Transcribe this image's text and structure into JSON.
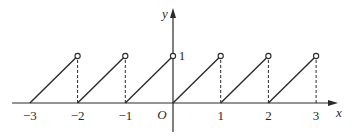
{
  "chart_data": {
    "type": "line",
    "title": "",
    "xlabel": "x",
    "ylabel": "y",
    "origin_label": "O",
    "x_ticks": [
      -3,
      -2,
      -1,
      1,
      2,
      3
    ],
    "x_tick_labels": [
      "−3",
      "−2",
      "−1",
      "1",
      "2",
      "3"
    ],
    "y_ticks": [
      1
    ],
    "y_tick_labels": [
      "1"
    ],
    "xlim": [
      -3.6,
      3.4
    ],
    "ylim": [
      -0.5,
      1.7
    ],
    "grid": false,
    "legend": null,
    "segments": [
      {
        "x": [
          -3,
          -2
        ],
        "y": [
          0,
          1
        ],
        "start": "closed",
        "end": "open"
      },
      {
        "x": [
          -2,
          -1
        ],
        "y": [
          0,
          1
        ],
        "start": "closed",
        "end": "open"
      },
      {
        "x": [
          -1,
          0
        ],
        "y": [
          0,
          1
        ],
        "start": "closed",
        "end": "open"
      },
      {
        "x": [
          0,
          1
        ],
        "y": [
          0,
          1
        ],
        "start": "closed",
        "end": "open"
      },
      {
        "x": [
          1,
          2
        ],
        "y": [
          0,
          1
        ],
        "start": "closed",
        "end": "open"
      },
      {
        "x": [
          2,
          3
        ],
        "y": [
          0,
          1
        ],
        "start": "closed",
        "end": "open"
      }
    ],
    "dashed_verticals": [
      {
        "x": -2,
        "y": [
          0,
          1
        ]
      },
      {
        "x": -1,
        "y": [
          0,
          1
        ]
      },
      {
        "x": 1,
        "y": [
          0,
          1
        ]
      },
      {
        "x": 2,
        "y": [
          0,
          1
        ]
      },
      {
        "x": 3,
        "y": [
          0,
          1
        ]
      }
    ],
    "open_points": [
      [
        -2,
        1
      ],
      [
        -1,
        1
      ],
      [
        0,
        1
      ],
      [
        1,
        1
      ],
      [
        2,
        1
      ],
      [
        3,
        1
      ]
    ]
  },
  "colors": {
    "ink": "#2a2a2a",
    "background": "#ffffff"
  }
}
